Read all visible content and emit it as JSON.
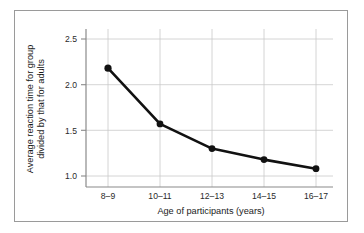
{
  "chart_data": {
    "type": "line",
    "title": "",
    "xlabel": "Age of participants (years)",
    "ylabel": "Average reaction time for group divided by that for adults",
    "ylabel_lines": [
      "Average reaction time for group",
      "divided by that for adults"
    ],
    "categories": [
      "8–9",
      "10–11",
      "12–13",
      "14–15",
      "16–17"
    ],
    "values": [
      2.18,
      1.57,
      1.3,
      1.18,
      1.08
    ],
    "series": [
      {
        "name": "Average reaction time ratio",
        "values": [
          2.18,
          1.57,
          1.3,
          1.18,
          1.08
        ]
      }
    ],
    "ylim": [
      0.95,
      2.62
    ],
    "yticks": [
      "2.5",
      "2.0",
      "1.5",
      "1.0"
    ],
    "ytick_values": [
      2.5,
      2.0,
      1.5,
      1.0
    ],
    "grid": true,
    "legend": "none",
    "marker": "filled-circle",
    "line_color": "#111111",
    "marker_color": "#111111",
    "grid_color": "#c9c9c9",
    "axis_color": "#8a8a8a",
    "frame_color": "#9a9a9a",
    "background": "#ffffff"
  },
  "labels": {
    "x_axis_title": "Age of participants (years)",
    "y_axis_title_line1": "Average reaction time for group",
    "y_axis_title_line2": "divided by that for adults",
    "ytick_0": "2.5",
    "ytick_1": "2.0",
    "ytick_2": "1.5",
    "ytick_3": "1.0",
    "xtick_0": "8–9",
    "xtick_1": "10–11",
    "xtick_2": "12–13",
    "xtick_3": "14–15",
    "xtick_4": "16–17"
  }
}
